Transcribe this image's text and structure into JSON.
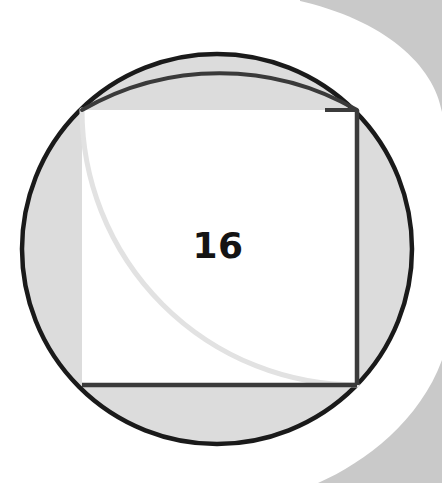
{
  "figure": {
    "canvas": {
      "width": 442,
      "height": 483
    },
    "label": {
      "text": "16",
      "x": 218,
      "y": 245
    },
    "colors": {
      "page_background": "#ffffff",
      "circle_fill": "#dcdcdc",
      "circle_stroke": "#1a1a1a",
      "square_fill": "#ffffff",
      "square_stroke": "#3b3b3b",
      "dark_arc_stroke": "#3a3a3a",
      "light_arc_stroke": "#e2e2e2",
      "decoration_gray": "#c9c9c9",
      "label_color": "#141414"
    },
    "circle": {
      "name": "outer-circle",
      "cx": 217,
      "cy": 249,
      "r": 195,
      "stroke_width": 4.5
    },
    "square": {
      "name": "inscribed-square",
      "x": 82,
      "y": 110,
      "width": 275,
      "height": 275,
      "side_label": "16",
      "stroke_width": 4,
      "stroked_edges": [
        "right",
        "bottom"
      ],
      "unstroked_edges": [
        "top",
        "left"
      ]
    },
    "arcs": [
      {
        "name": "dark-quarter-arc",
        "center_corner": "bottom-left",
        "cx": 82,
        "cy": 385,
        "radius": 275,
        "from_x": 82,
        "from_y": 110,
        "to_x": 357,
        "to_y": 110,
        "stroke": "#3a3a3a",
        "stroke_width": 4
      },
      {
        "name": "light-quarter-arc",
        "center_corner": "top-right",
        "cx": 357,
        "cy": 110,
        "radius": 275,
        "from_x": 82,
        "from_y": 110,
        "to_x": 357,
        "to_y": 385,
        "stroke": "#e2e2e2",
        "stroke_width": 5
      }
    ],
    "decorations": [
      {
        "name": "corner-swoosh-top-right",
        "position": "top-right"
      },
      {
        "name": "corner-swoosh-bottom-right",
        "position": "bottom-right"
      }
    ]
  }
}
